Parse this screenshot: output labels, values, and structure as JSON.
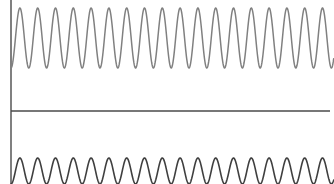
{
  "figure": {
    "name": "dual-sine-waveform-plot",
    "width": 334,
    "height": 184,
    "background_color": "#ffffff"
  },
  "axes": {
    "vertical_axis": {
      "label": "y-axis",
      "x": 11,
      "y_start": 0,
      "y_end": 184,
      "color": "#4a4a4a",
      "width": 1.4
    },
    "horizontal_axis": {
      "label": "x-axis",
      "y": 111,
      "x_start": 11,
      "x_end": 330,
      "color": "#4a4a4a",
      "width": 1.3
    }
  },
  "chart_data": {
    "type": "line",
    "title": "",
    "subtitle": "",
    "xlabel": "",
    "ylabel": "",
    "grid": false,
    "legend": "none",
    "xlim": [
      0,
      334
    ],
    "ylim": [
      0,
      184
    ],
    "tick_labels_x": [],
    "tick_labels_y": [],
    "annotations": [],
    "series": [
      {
        "name": "upper-sine-wave",
        "type": "sine",
        "color": "#808080",
        "line_width": 1.5,
        "cycles": 18,
        "period_px": 17.8,
        "amplitude_px": 30,
        "center_y_px": 38,
        "peak_y_px": 8,
        "trough_y_px": 68,
        "x_start_px": 11,
        "x_end_px": 334,
        "phase_deg": 180,
        "clipped": false
      },
      {
        "name": "lower-sine-wave",
        "type": "sine",
        "color": "#3f3f3f",
        "line_width": 1.6,
        "cycles": 18,
        "period_px": 17.8,
        "amplitude_px": 13,
        "center_y_px": 171,
        "peak_y_px": 158,
        "trough_y_px": 184,
        "x_start_px": 11,
        "x_end_px": 334,
        "phase_deg": 180,
        "clipped": true
      }
    ]
  }
}
